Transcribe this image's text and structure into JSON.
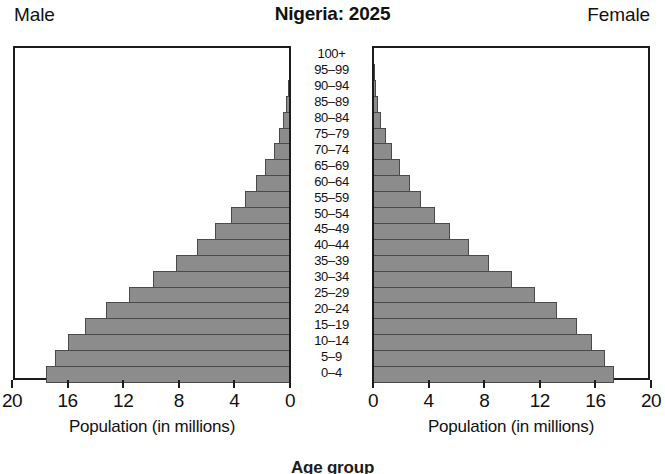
{
  "header": {
    "male_label": "Male",
    "title": "Nigeria: 2025",
    "female_label": "Female"
  },
  "axis": {
    "male_caption": "Population (in millions)",
    "female_caption": "Population (in millions)",
    "age_group_caption": "Age group",
    "male_ticks": [
      "20",
      "16",
      "12",
      "8",
      "4",
      "0"
    ],
    "female_ticks": [
      "0",
      "4",
      "8",
      "12",
      "16",
      "20"
    ]
  },
  "chart_data": {
    "type": "bar",
    "subtype": "population-pyramid",
    "title": "Nigeria: 2025",
    "xlabel": "Population (in millions)",
    "ylabel": "Age group",
    "xlim": [
      0,
      20
    ],
    "xticks": [
      0,
      4,
      8,
      12,
      16,
      20
    ],
    "grid": false,
    "legend": [
      "Male",
      "Female"
    ],
    "legend_position": "top-outside",
    "categories": [
      "100+",
      "95–99",
      "90–94",
      "85–89",
      "80–84",
      "75–79",
      "70–74",
      "65–69",
      "60–64",
      "55–59",
      "50–54",
      "45–49",
      "40–44",
      "35–39",
      "30–34",
      "25–29",
      "20–24",
      "15–19",
      "10–14",
      "5–9",
      "0–4"
    ],
    "series": [
      {
        "name": "Male",
        "direction": "left",
        "values": [
          0.01,
          0.04,
          0.1,
          0.2,
          0.4,
          0.7,
          1.1,
          1.7,
          2.4,
          3.2,
          4.2,
          5.3,
          6.6,
          8.1,
          9.8,
          11.5,
          13.2,
          14.7,
          15.9,
          16.8,
          17.5
        ]
      },
      {
        "name": "Female",
        "direction": "right",
        "values": [
          0.02,
          0.06,
          0.14,
          0.28,
          0.5,
          0.85,
          1.3,
          1.9,
          2.6,
          3.4,
          4.4,
          5.5,
          6.8,
          8.3,
          9.9,
          11.6,
          13.2,
          14.6,
          15.7,
          16.6,
          17.3
        ]
      }
    ]
  },
  "render": {
    "bar_fill": "#8c8c8c",
    "bar_stroke": "#4a4a4a",
    "axis_color": "#1c1c1c",
    "background": "#ffffff"
  }
}
